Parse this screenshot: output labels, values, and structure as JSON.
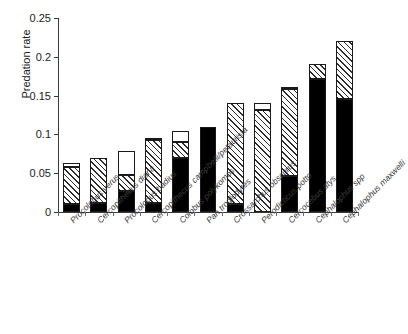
{
  "chart_data": {
    "type": "bar",
    "title": "",
    "xlabel": "",
    "ylabel": "Predation rate",
    "ylim": [
      0,
      0.25
    ],
    "yticks": [
      0,
      0.05,
      0.1,
      0.15,
      0.2,
      0.25
    ],
    "ytick_labels": [
      "0",
      "0.05",
      "0.1",
      "0.15",
      "0.2",
      "0.25"
    ],
    "grid": false,
    "legend": "none",
    "stacked": true,
    "categories": [
      "Procolobus verus",
      "Cercopithecus diana",
      "Procolobus badius",
      "Cercopithecus campbelli/petaurista",
      "Colobus polykomos",
      "Pan troglodytes",
      "Crossarchus obscurus",
      "Perodicticus potto",
      "Cercocebus atys",
      "Cephalophus spp",
      "Cephalophus maxwelli"
    ],
    "series": [
      {
        "name": "black-segment",
        "fill": "solid-black",
        "values": [
          0.01,
          0.012,
          0.027,
          0.012,
          0.07,
          0.109,
          0.01,
          0.0,
          0.046,
          0.172,
          0.145
        ]
      },
      {
        "name": "hatched-segment",
        "fill": "diagonal-hatch",
        "values": [
          0.048,
          0.057,
          0.021,
          0.081,
          0.02,
          0.0,
          0.13,
          0.131,
          0.112,
          0.019,
          0.076
        ]
      },
      {
        "name": "white-segment",
        "fill": "open-white",
        "values": [
          0.005,
          0.0,
          0.031,
          0.001,
          0.015,
          0.0,
          0.0,
          0.009,
          0.002,
          0.0,
          0.0
        ]
      }
    ],
    "totals": [
      0.063,
      0.069,
      0.079,
      0.094,
      0.105,
      0.109,
      0.14,
      0.14,
      0.16,
      0.191,
      0.221
    ]
  }
}
